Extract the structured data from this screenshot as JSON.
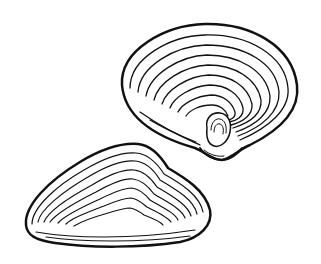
{
  "image": {
    "subject": "Two clam shells illustration",
    "style": "black ink line drawing",
    "background": "#ffffff",
    "ink": "#111111",
    "shells": [
      {
        "name": "upper-right-clam",
        "view": "interior-facing umbo view"
      },
      {
        "name": "lower-left-clam",
        "view": "exterior side view"
      }
    ]
  }
}
